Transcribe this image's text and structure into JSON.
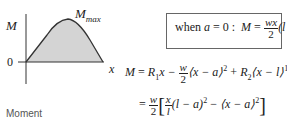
{
  "plot": {
    "y_axis_label": "M",
    "x_axis_label": "x",
    "origin_label": "0",
    "peak_label_main": "M",
    "peak_label_sub": "max",
    "fill_color": "#d4d4d4",
    "curve_color": "#333333"
  },
  "caption": "Moment",
  "boxed_equation": {
    "prefix": "when",
    "var_a": "a",
    "eq_zero": "= 0 :",
    "lhs": "M",
    "equals": "=",
    "num": "wx",
    "den": "2",
    "tail": "(l − x)"
  },
  "equation1": {
    "lhs": "M",
    "equals": "=",
    "term1": "R",
    "term1_sub": "1",
    "term1_var": "x −",
    "frac_num": "w",
    "frac_den": "2",
    "bracket1": "⟨x − a⟩",
    "sup1": "2",
    "plus": "+",
    "term3": "R",
    "term3_sub": "2",
    "bracket2": "⟨x − l⟩",
    "sup2": "1"
  },
  "equation2": {
    "equals": "=",
    "frac_num": "w",
    "frac_den": "2",
    "inner_num": "x",
    "inner_den": "l",
    "part1": "(l − a)",
    "sup1": "2",
    "minus": "−",
    "part2": "⟨x − a⟩",
    "sup2": "2"
  }
}
